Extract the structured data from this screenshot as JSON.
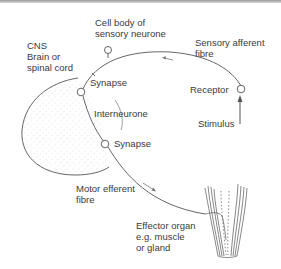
{
  "diagram": {
    "type": "reflex arc",
    "colors": {
      "line": "#555555",
      "text": "#3a3a3a",
      "stipple": "#b8b8b8",
      "top_bar": "#a0a0a0"
    },
    "labels": {
      "cns_line1": "CNS",
      "cns_line2": "Brain or",
      "cns_line3": "spinal cord",
      "cell_body_line1": "Cell body of",
      "cell_body_line2": "sensory neurone",
      "sensory_fibre_line1": "Sensory afferent",
      "sensory_fibre_line2": "fibre",
      "synapse_upper": "Synapse",
      "interneurone": "Interneurone",
      "synapse_lower": "Synapse",
      "receptor": "Receptor",
      "stimulus": "Stimulus",
      "motor_fibre_line1": "Motor efferent",
      "motor_fibre_line2": "fibre",
      "effector_line1": "Effector organ",
      "effector_line2": "e.g. muscle",
      "effector_line3": "or gland"
    },
    "nodes": [
      {
        "name": "receptor"
      },
      {
        "name": "cell-body"
      },
      {
        "name": "synapse-upper"
      },
      {
        "name": "synapse-lower"
      }
    ],
    "arrows": [
      {
        "name": "sensory-direction",
        "direction": "left"
      },
      {
        "name": "motor-direction",
        "direction": "down-right"
      },
      {
        "name": "stimulus",
        "direction": "up"
      }
    ]
  }
}
